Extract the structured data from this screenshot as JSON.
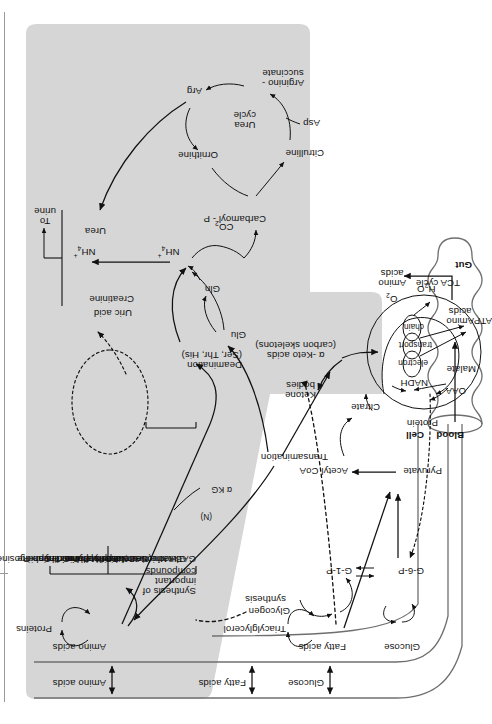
{
  "figure": {
    "orientation": "rotated-90",
    "colors": {
      "shaded_region": "#d6d6d6",
      "stroke": "#111111",
      "rule": "#9a9a9a"
    }
  },
  "compartments": {
    "gut": "Gut",
    "blood": "Blood",
    "cell": "Cell"
  },
  "gut_nodes": {
    "protein": "Protein",
    "amino_acids_gut": "Amino\nacids",
    "amino_acids_out": "Amino\nacids"
  },
  "blood_nodes": {
    "amino_acids": "Amino acids",
    "fatty_acids": "Fatty acids",
    "glucose": "Glucose"
  },
  "cell_nodes": {
    "amino_acids": "Amino acids",
    "proteins": "Proteins",
    "fatty_acids": "Fatty acids",
    "triacylglycerol": "Triacylglycerol",
    "synthesis": "synthesis",
    "glucose": "Glucose",
    "glycogen": "Glycogen",
    "g1p": "G-1-P",
    "g6p": "G-6-P",
    "pyruvate": "Pyruvate",
    "acetyl_coa": "Acetyl CoA",
    "ketone_bodies": "Ketone\nbodies",
    "keto_acids": "α -Keto acids\n(carbon skeletons)",
    "synthesis_of_important_compounds": "Synthesis of\nimportant\ncompounds",
    "nitrogen_tag": "(N)",
    "alpha_kg": "α KG",
    "transamination": "Transamination",
    "deamination": "Deamination\n(Ser, Thr, His)"
  },
  "important_compounds": [
    "GABA",
    "Glutathione",
    "Heme",
    "Nicotinamide",
    "  (NAD,NADP)",
    "Serotonin",
    "Melatonin",
    "Norepinephrine",
    "Epinephrine",
    "Histamine",
    "Melanin",
    "Pyrimidines",
    "Purines",
    "Creatine-P",
    "Thyroxine",
    "Sphingosine"
  ],
  "excretion": {
    "uric_acid": "Uric acid",
    "creatinine": "Creatinine",
    "ammonium": "NH",
    "ammonium_sub": "4",
    "ammonium_sup": "+",
    "urea": "Urea",
    "to_urine": "To\nurine"
  },
  "nitrogen_nodes": {
    "gln": "Gln",
    "glu": "Glu",
    "nh4": "NH",
    "nh4_sub": "4",
    "nh4_sup": "+",
    "co2": "CO",
    "co2_sub": "2",
    "carbamoyl_p": "Carbamoyl - P"
  },
  "urea_cycle": {
    "title": "Urea\ncycle",
    "ornithine": "Ornithine",
    "citrulline": "Citrulline",
    "asp": "Asp",
    "argininosuccinate": "Arginino -\nsuccinate",
    "arg": "Arg"
  },
  "tca": {
    "title": "TCA cycle",
    "citrate": "Citrate",
    "oaa": "OAA",
    "malate": "Malate",
    "nadh": "NADH",
    "etc_line1": "electron",
    "etc_line2": "transport",
    "etc_line3": "chain",
    "o2": "O",
    "o2_sub": "2",
    "h2o": "H",
    "h2o_sub": "2",
    "h2o_tail": "O",
    "atp": "ATP"
  }
}
